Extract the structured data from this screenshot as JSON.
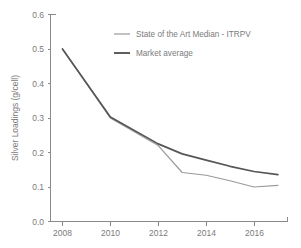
{
  "chart_data": {
    "type": "line",
    "title": "",
    "xlabel": "",
    "ylabel": "Silver Loadings (g/cell)",
    "xlim": [
      2007.5,
      2017.4
    ],
    "ylim": [
      0.0,
      0.6
    ],
    "grid": false,
    "legend_position": "top-center",
    "xticks": [
      2008,
      2010,
      2012,
      2014,
      2016
    ],
    "xtick_labels": [
      "2008",
      "2010",
      "2012",
      "2014",
      "2016"
    ],
    "yticks": [
      0.0,
      0.1,
      0.2,
      0.3,
      0.4,
      0.5,
      0.6
    ],
    "ytick_labels": [
      "0.0",
      "0.1",
      "0.2",
      "0.3",
      "0.4",
      "0.5",
      "0.6"
    ],
    "x": [
      2008,
      2010,
      2012,
      2013,
      2014,
      2015,
      2016,
      2017
    ],
    "series": [
      {
        "name": "State of the Art Median - ITRPV",
        "color": "#9a9a9a",
        "values": [
          0.5,
          0.3,
          0.22,
          0.142,
          0.134,
          0.118,
          0.1,
          0.105
        ]
      },
      {
        "name": "Market average",
        "color": "#565656",
        "values": [
          0.5,
          0.303,
          0.225,
          0.196,
          0.178,
          0.16,
          0.145,
          0.136
        ]
      }
    ]
  },
  "legend": {
    "entries": [
      {
        "label": "State of the Art Median - ITRPV"
      },
      {
        "label": "Market average"
      }
    ]
  },
  "axes": {
    "y_title": "Silver Loadings (g/cell)"
  }
}
